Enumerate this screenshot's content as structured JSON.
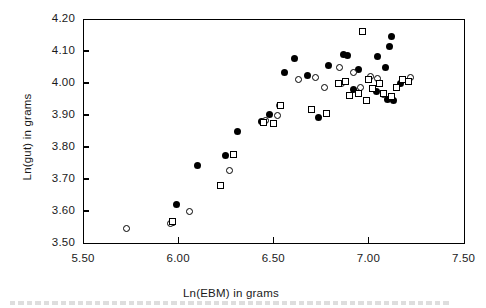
{
  "chart_data": {
    "type": "scatter",
    "title": "",
    "xlabel": "Ln(EBM) in grams",
    "ylabel": "Ln(gut) in grams",
    "xlim": [
      5.5,
      7.5
    ],
    "ylim": [
      3.5,
      4.2
    ],
    "xticks": [
      "5.50",
      "6.00",
      "6.50",
      "7.00",
      "7.50"
    ],
    "xtick_values": [
      5.5,
      6.0,
      6.5,
      7.0,
      7.5
    ],
    "yticks": [
      "3.50",
      "3.60",
      "3.70",
      "3.80",
      "3.90",
      "4.00",
      "4.10",
      "4.20"
    ],
    "ytick_values": [
      3.5,
      3.6,
      3.7,
      3.8,
      3.9,
      4.0,
      4.1,
      4.2
    ],
    "grid": false,
    "legend": "none",
    "frame": "box",
    "marker_colors": {
      "filled_circle": "#000000",
      "open_circle": "#000000",
      "open_square": "#000000"
    },
    "series": [
      {
        "name": "filled-circle",
        "marker": "filled-circle",
        "points": [
          [
            5.97,
            3.565
          ],
          [
            5.99,
            3.619
          ],
          [
            6.1,
            3.743
          ],
          [
            6.25,
            3.775
          ],
          [
            6.31,
            3.848
          ],
          [
            6.44,
            3.88
          ],
          [
            6.48,
            3.902
          ],
          [
            6.56,
            4.032
          ],
          [
            6.61,
            4.077
          ],
          [
            6.68,
            4.025
          ],
          [
            6.79,
            4.055
          ],
          [
            6.87,
            4.088
          ],
          [
            6.89,
            4.086
          ],
          [
            6.95,
            4.043
          ],
          [
            7.05,
            4.082
          ],
          [
            7.09,
            4.049
          ],
          [
            7.11,
            4.115
          ],
          [
            7.12,
            4.145
          ],
          [
            6.92,
            3.981
          ],
          [
            7.04,
            3.972
          ],
          [
            7.1,
            3.948
          ],
          [
            7.13,
            3.944
          ],
          [
            6.74,
            3.893
          ],
          [
            7.17,
            3.999
          ]
        ]
      },
      {
        "name": "open-circle",
        "marker": "open-circle",
        "points": [
          [
            5.73,
            3.546
          ],
          [
            5.96,
            3.562
          ],
          [
            6.06,
            3.598
          ],
          [
            6.27,
            3.726
          ],
          [
            6.46,
            3.882
          ],
          [
            6.52,
            3.898
          ],
          [
            6.63,
            4.012
          ],
          [
            6.72,
            4.016
          ],
          [
            6.77,
            3.985
          ],
          [
            6.85,
            4.048
          ],
          [
            6.86,
            4.0
          ],
          [
            6.92,
            4.033
          ],
          [
            7.01,
            4.019
          ],
          [
            7.05,
            4.015
          ],
          [
            7.08,
            3.963
          ],
          [
            7.22,
            4.018
          ],
          [
            6.53,
            3.93
          ],
          [
            6.96,
            3.985
          ]
        ]
      },
      {
        "name": "open-square",
        "marker": "open-square",
        "points": [
          [
            5.97,
            3.567
          ],
          [
            6.22,
            3.68
          ],
          [
            6.29,
            3.778
          ],
          [
            6.45,
            3.876
          ],
          [
            6.5,
            3.872
          ],
          [
            6.54,
            3.93
          ],
          [
            6.7,
            3.916
          ],
          [
            6.78,
            3.904
          ],
          [
            6.84,
            3.998
          ],
          [
            6.88,
            4.006
          ],
          [
            6.95,
            3.968
          ],
          [
            6.97,
            4.16
          ],
          [
            7.0,
            4.012
          ],
          [
            7.02,
            3.984
          ],
          [
            7.06,
            3.998
          ],
          [
            7.08,
            3.966
          ],
          [
            7.12,
            3.959
          ],
          [
            7.15,
            3.986
          ],
          [
            7.18,
            4.01
          ],
          [
            7.21,
            4.006
          ],
          [
            6.99,
            3.944
          ],
          [
            6.9,
            3.962
          ]
        ]
      }
    ]
  },
  "figure": {
    "xlabel_text": "Ln(EBM) in grams",
    "ylabel_text": "Ln(gut) in grams"
  }
}
